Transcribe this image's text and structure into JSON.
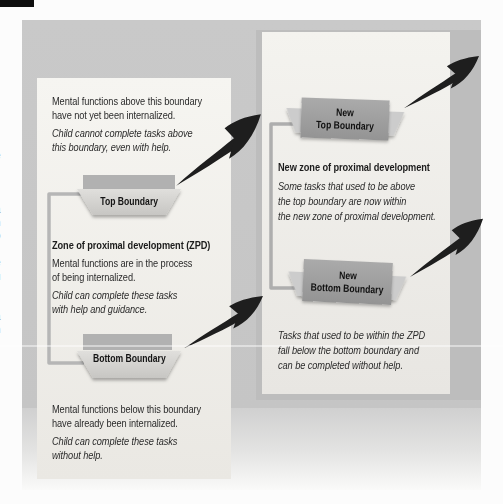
{
  "figure": {
    "title_semantic": "How the Zone of Proximal Development works",
    "left": {
      "note_above": [
        "Mental functions above this boundary",
        "have not yet been internalized."
      ],
      "child_above": [
        "Child cannot complete tasks above",
        "this boundary, even with help."
      ],
      "top_boundary_label": "Top Boundary",
      "zpd_heading": "Zone of proximal development (ZPD)",
      "note_zpd": [
        "Mental functions are in the process",
        "of being internalized."
      ],
      "child_zpd": [
        "Child can complete these tasks",
        "with help and guidance."
      ],
      "bottom_boundary_label": "Bottom Boundary",
      "note_below": [
        "Mental functions below this boundary",
        "have already been internalized."
      ],
      "child_below": [
        "Child can complete these tasks",
        "without help."
      ]
    },
    "right": {
      "new_top_boundary_label": [
        "New",
        "Top Boundary"
      ],
      "new_zpd_heading": "New zone of proximal development",
      "new_zpd_note": [
        "Some tasks that used to be above",
        "the top boundary are now within",
        "the new zone of proximal development."
      ],
      "new_bottom_boundary_label": [
        "New",
        "Bottom Boundary"
      ],
      "below_note": [
        "Tasks that used to be within the ZPD",
        "fall below the bottom boundary and",
        "can be completed without help."
      ]
    }
  },
  "margin_fragments": "e\nr\ns\nt\na\nn\no\ni\ne\nu\nr\ns\na\nn",
  "colors": {
    "outer_panel": "#c6c6c6",
    "right_panel_frame": "#bdbdbd",
    "inner_card": "#f4f3ef",
    "boundary_bar": "#b1b1b1",
    "tray_light": "#d9d8d5",
    "new_boundary_box": "#9e9e9e",
    "bracket_line": "#b6b6b6",
    "arrow_black": "#1e1e1e"
  }
}
